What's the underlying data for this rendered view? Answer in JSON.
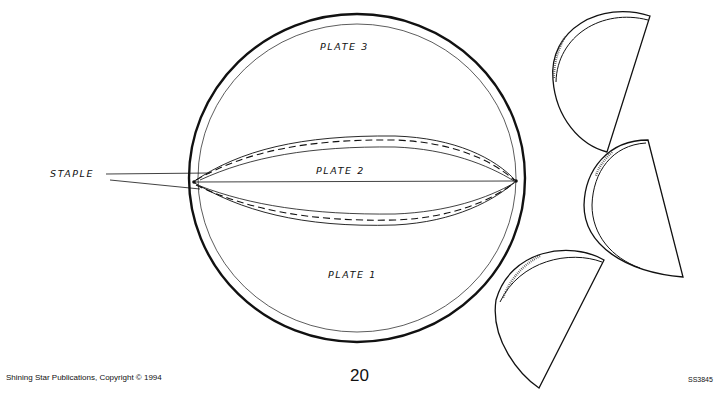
{
  "labels": {
    "staple": "STAPLE",
    "plate_1": "PLATE 1",
    "plate_2": "PLATE 2",
    "plate_3": "PLATE 3"
  },
  "footer": {
    "publisher": "Shining Star Publications, Copyright © 1994",
    "page_number": "20",
    "product_code": "SS3845"
  },
  "colors": {
    "ink": "#111111",
    "paper": "#ffffff"
  }
}
